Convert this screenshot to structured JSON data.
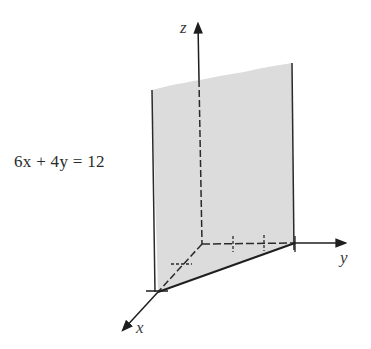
{
  "figure": {
    "equation": "6x + 4y = 12",
    "axes": {
      "x_label": "x",
      "y_label": "y",
      "z_label": "z"
    },
    "plane": {
      "x_intercept": 2,
      "y_intercept": 3,
      "fill_color": "#dcdcdc",
      "line_color": "#2a2a2a"
    },
    "ticks": {
      "x": [
        1
      ],
      "y": [
        1,
        2
      ]
    }
  }
}
